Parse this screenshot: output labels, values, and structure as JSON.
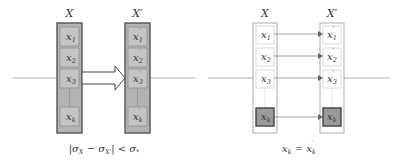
{
  "left_panel": {
    "set_label": "X",
    "set_prime_label": "X′",
    "items": [
      {
        "base": "x",
        "sub": "1"
      },
      {
        "base": "x",
        "sub": "2"
      },
      {
        "base": "x",
        "sub": "3"
      },
      {
        "base": "x",
        "sub": "k"
      }
    ],
    "items_prime": [
      {
        "base": "x",
        "sub": "1",
        "prime": "′"
      },
      {
        "base": "x",
        "sub": "2",
        "prime": "′"
      },
      {
        "base": "x",
        "sub": "3",
        "prime": "′"
      },
      {
        "base": "x",
        "sub": "k",
        "prime": "′"
      }
    ],
    "caption": "|σX − σX′| < σ*",
    "caption_parts": {
      "bar_open": "|",
      "sigma1": "σ",
      "sub1": "X",
      "minus": " − ",
      "sigma2": "σ",
      "sub2": "X′",
      "bar_close": "|",
      "lt": " < ",
      "sigma3": "σ",
      "sub3": "*"
    }
  },
  "right_panel": {
    "set_label": "X",
    "set_prime_label": "X′",
    "items": [
      {
        "base": "x",
        "sub": "1"
      },
      {
        "base": "x",
        "sub": "2"
      },
      {
        "base": "x",
        "sub": "3"
      },
      {
        "base": "x",
        "sub": "k"
      }
    ],
    "items_prime": [
      {
        "base": "x",
        "sub": "1",
        "prime": "′"
      },
      {
        "base": "x",
        "sub": "2",
        "prime": "′"
      },
      {
        "base": "x",
        "sub": "3",
        "prime": "′"
      },
      {
        "base": "x",
        "sub": "k",
        "prime": "′"
      }
    ],
    "caption_parts": {
      "lhs": "x",
      "lhs_sub": "k",
      "eq": " = ",
      "rhs": "x",
      "rhs_sub": "k",
      "rhs_prime": "′"
    }
  },
  "colors": {
    "container_fill_left": "#b3b3b3",
    "item_fill_left": "#c4c4c4",
    "highlight_fill": "#9a9a9a",
    "stroke": "#555555",
    "light_stroke": "#c8c8c8",
    "line": "#999999"
  }
}
